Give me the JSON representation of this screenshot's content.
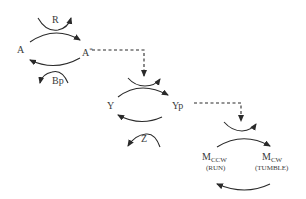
{
  "diagram": {
    "type": "signaling pathway",
    "nodes": {
      "a": "A",
      "a_star": "A",
      "a_star_sup": "*",
      "y": "Y",
      "yp": "Yp",
      "m_ccw": "M",
      "m_ccw_sub": "CCW",
      "m_ccw_note": "(RUN)",
      "m_cw": "M",
      "m_cw_sub": "CW",
      "m_cw_note": "(TUMBLE)"
    },
    "catalysts": {
      "r": "R",
      "bp": "Bp",
      "z": "Z"
    },
    "edges": [
      {
        "from": "A",
        "to": "A*",
        "catalyst": "R"
      },
      {
        "from": "A*",
        "to": "A",
        "catalyst": "Bp"
      },
      {
        "from": "A*",
        "to": "Y→Yp",
        "style": "dashed"
      },
      {
        "from": "Y",
        "to": "Yp"
      },
      {
        "from": "Yp",
        "to": "Y",
        "catalyst": "Z"
      },
      {
        "from": "Yp",
        "to": "MCCW→MCW",
        "style": "dashed"
      },
      {
        "from": "MCCW",
        "to": "MCW"
      },
      {
        "from": "MCW",
        "to": "MCCW"
      }
    ],
    "colors": {
      "line": "#2a2a2a",
      "text": "#3a3a3a",
      "background": "#ffffff"
    }
  }
}
